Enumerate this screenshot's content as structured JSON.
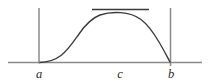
{
  "figure": {
    "kind": "math-diagram",
    "background_color": "#ffffff",
    "width": 208,
    "height": 82
  },
  "axis": {
    "name": "horizontal-axis",
    "color": "#8a8a8a",
    "stroke_width": 1.6,
    "x_start": 8,
    "x_end": 202,
    "y": 62.5
  },
  "boundaries": [
    {
      "id": "left-bound",
      "label": "a",
      "color": "#8a8a8a",
      "stroke_width": 1.5,
      "x": 39,
      "y_top": 8,
      "y_bottom": 63.5,
      "label_x": 39,
      "label_y": 78
    },
    {
      "id": "right-bound",
      "label": "b",
      "color": "#8a8a8a",
      "stroke_width": 1.5,
      "x": 170.5,
      "y_top": 8,
      "y_bottom": 66,
      "label_x": 171,
      "label_y": 78
    }
  ],
  "critical_point": {
    "id": "maximum-point",
    "label": "c",
    "x": 120,
    "label_x": 120,
    "label_y": 78,
    "curve_peak_y": 13
  },
  "tangent": {
    "name": "horizontal-tangent-line",
    "color": "#3a3a3a",
    "stroke_width": 1.5,
    "x_start": 92,
    "x_end": 149,
    "y": 9.5
  },
  "curve": {
    "name": "function-curve",
    "color": "#3a3a3a",
    "stroke_width": 1.35,
    "shape": "sigmoidal-rise-to-flat-maximum-then-steep-fall",
    "path": "M 39.5 62.5 C 48 62.3 55 60.0 61 55.5 C 68 50.2 73 42.5 79 34.0 C 85 25.2 92 18.0 100 15.0 C 107 12.6 114 12.2 120.5 12.6 C 128 13.1 135 15.0 141 19.5 C 148 24.8 154 33.5 159 42.0 C 163.5 49.5 167 56.5 170.3 62.5",
    "anchor_left_x": 39.5,
    "anchor_right_x": 170.3,
    "baseline_y": 62.5
  },
  "labels": {
    "font_size": 12.5,
    "color": "#2b2b2b",
    "items": [
      {
        "id": "label-a",
        "text": "a"
      },
      {
        "id": "label-c",
        "text": "c"
      },
      {
        "id": "label-b",
        "text": "b"
      }
    ]
  }
}
